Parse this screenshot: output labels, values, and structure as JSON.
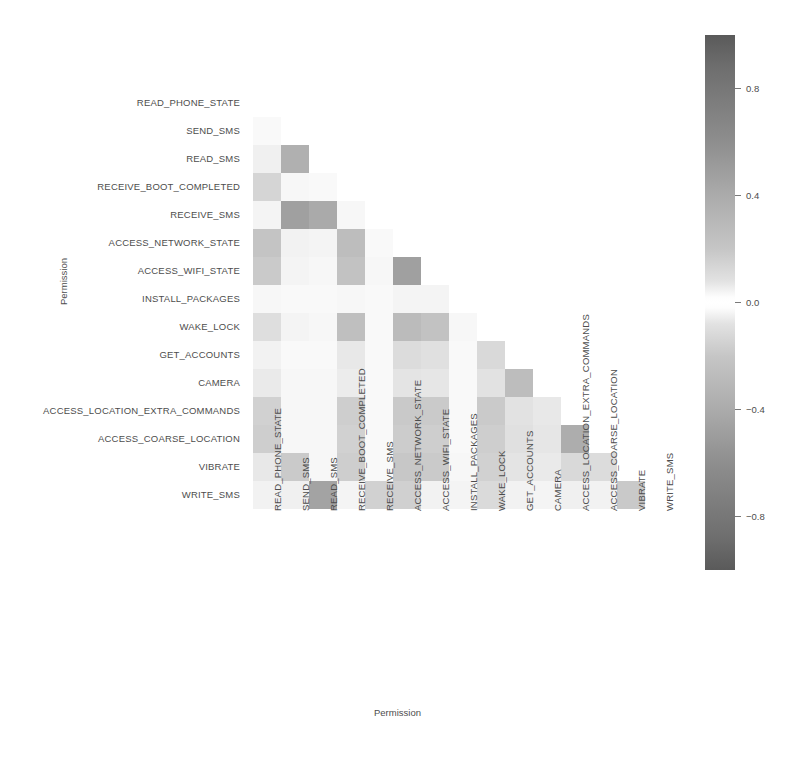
{
  "figure": {
    "xlabel": "Permission",
    "ylabel": "Permission"
  },
  "colorbar": {
    "ticks": [
      "0.8",
      "0.4",
      "0.0",
      "−0.4",
      "−0.8"
    ],
    "tick_values": [
      0.8,
      0.4,
      0.0,
      -0.4,
      -0.8
    ],
    "vmin": -1.0,
    "vmax": 1.0,
    "colormap": "gray-diverging",
    "high_color": "#5a5a5a",
    "mid_color": "#ffffff",
    "low_color": "#5a5a5a"
  },
  "chart_data": {
    "type": "heatmap",
    "title": "",
    "xlabel": "Permission",
    "ylabel": "Permission",
    "grid": false,
    "legend_position": "right",
    "mask": "upper-triangle-hidden",
    "categories": [
      "READ_PHONE_STATE",
      "SEND_SMS",
      "READ_SMS",
      "RECEIVE_BOOT_COMPLETED",
      "RECEIVE_SMS",
      "ACCESS_NETWORK_STATE",
      "ACCESS_WIFI_STATE",
      "INSTALL_PACKAGES",
      "WAKE_LOCK",
      "GET_ACCOUNTS",
      "CAMERA",
      "ACCESS_LOCATION_EXTRA_COMMANDS",
      "ACCESS_COARSE_LOCATION",
      "VIBRATE",
      "WRITE_SMS"
    ],
    "x": [
      "READ_PHONE_STATE",
      "SEND_SMS",
      "READ_SMS",
      "RECEIVE_BOOT_COMPLETED",
      "RECEIVE_SMS",
      "ACCESS_NETWORK_STATE",
      "ACCESS_WIFI_STATE",
      "INSTALL_PACKAGES",
      "WAKE_LOCK",
      "GET_ACCOUNTS",
      "CAMERA",
      "ACCESS_LOCATION_EXTRA_COMMANDS",
      "ACCESS_COARSE_LOCATION",
      "VIBRATE",
      "WRITE_SMS"
    ],
    "y": [
      "READ_PHONE_STATE",
      "SEND_SMS",
      "READ_SMS",
      "RECEIVE_BOOT_COMPLETED",
      "RECEIVE_SMS",
      "ACCESS_NETWORK_STATE",
      "ACCESS_WIFI_STATE",
      "INSTALL_PACKAGES",
      "WAKE_LOCK",
      "GET_ACCOUNTS",
      "CAMERA",
      "ACCESS_LOCATION_EXTRA_COMMANDS",
      "ACCESS_COARSE_LOCATION",
      "VIBRATE",
      "WRITE_SMS"
    ],
    "values": [
      [
        null,
        null,
        null,
        null,
        null,
        null,
        null,
        null,
        null,
        null,
        null,
        null,
        null,
        null,
        null
      ],
      [
        0.02,
        null,
        null,
        null,
        null,
        null,
        null,
        null,
        null,
        null,
        null,
        null,
        null,
        null,
        null
      ],
      [
        0.06,
        0.42,
        null,
        null,
        null,
        null,
        null,
        null,
        null,
        null,
        null,
        null,
        null,
        null,
        null
      ],
      [
        0.2,
        0.03,
        0.02,
        null,
        null,
        null,
        null,
        null,
        null,
        null,
        null,
        null,
        null,
        null,
        null
      ],
      [
        0.04,
        0.52,
        0.46,
        0.03,
        null,
        null,
        null,
        null,
        null,
        null,
        null,
        null,
        null,
        null,
        null
      ],
      [
        0.3,
        0.05,
        0.04,
        0.34,
        0.02,
        null,
        null,
        null,
        null,
        null,
        null,
        null,
        null,
        null,
        null
      ],
      [
        0.26,
        0.04,
        0.03,
        0.31,
        0.03,
        0.52,
        null,
        null,
        null,
        null,
        null,
        null,
        null,
        null,
        null
      ],
      [
        0.03,
        0.02,
        0.02,
        0.03,
        0.02,
        0.04,
        0.04,
        null,
        null,
        null,
        null,
        null,
        null,
        null,
        null
      ],
      [
        0.15,
        0.04,
        0.03,
        0.33,
        0.02,
        0.35,
        0.31,
        0.03,
        null,
        null,
        null,
        null,
        null,
        null,
        null
      ],
      [
        0.05,
        0.02,
        0.02,
        0.1,
        0.02,
        0.16,
        0.14,
        0.02,
        0.18,
        null,
        null,
        null,
        null,
        null,
        null
      ],
      [
        0.09,
        0.03,
        0.03,
        0.08,
        0.02,
        0.12,
        0.11,
        0.02,
        0.13,
        0.34,
        null,
        null,
        null,
        null,
        null
      ],
      [
        0.22,
        0.03,
        0.03,
        0.24,
        0.02,
        0.27,
        0.26,
        0.02,
        0.26,
        0.13,
        0.1,
        null,
        null,
        null,
        null
      ],
      [
        0.24,
        0.03,
        0.03,
        0.22,
        0.02,
        0.25,
        0.24,
        0.02,
        0.24,
        0.14,
        0.11,
        0.44,
        null,
        null,
        null
      ],
      [
        0.1,
        0.26,
        0.03,
        0.24,
        0.02,
        0.28,
        0.26,
        0.03,
        0.22,
        0.12,
        0.09,
        0.18,
        0.16,
        null,
        null
      ],
      [
        0.05,
        0.06,
        0.5,
        0.04,
        0.22,
        0.23,
        0.05,
        0.04,
        0.17,
        0.05,
        0.04,
        0.06,
        0.05,
        0.27,
        null
      ]
    ]
  }
}
